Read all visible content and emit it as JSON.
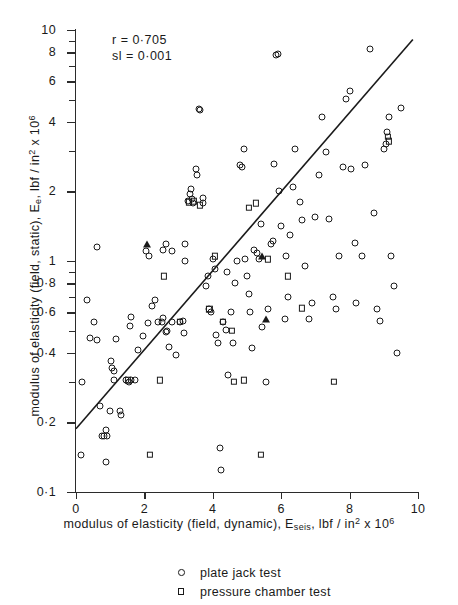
{
  "annotation": {
    "correlation": "r = 0·705",
    "significance": "sl = 0·001"
  },
  "chart_data": {
    "type": "scatter",
    "title": "",
    "xlabel": "modulus of elasticity (field, dynamic), E_seis, lbf / in^2 x 10^6",
    "ylabel": "modulus of elasticity (field, static), E_e, lbf / in^2 x 10^6",
    "xscale": "linear",
    "yscale": "log",
    "xlim": [
      0,
      10
    ],
    "ylim": [
      0.1,
      10
    ],
    "grid": false,
    "legend_position": "below-plot",
    "xticks": [
      "0",
      "2",
      "4",
      "6",
      "8",
      "10"
    ],
    "xtick_values": [
      0,
      2,
      4,
      6,
      8,
      10
    ],
    "yticks": [
      "0·1",
      "0·2",
      "0·4",
      "0·6",
      "0·8",
      "1",
      "2",
      "4",
      "6",
      "8",
      "10"
    ],
    "ytick_values": [
      0.1,
      0.2,
      0.4,
      0.6,
      0.8,
      1,
      2,
      4,
      6,
      8,
      10
    ],
    "yminor_values": [
      0.3,
      0.5,
      0.7,
      0.9,
      3,
      5,
      7,
      9
    ],
    "annotations": [
      "r = 0·705",
      "sl = 0·001"
    ],
    "fit_line": {
      "label": "regression line",
      "x": [
        0.0,
        9.85
      ],
      "y": [
        0.188,
        9.1
      ]
    },
    "series": [
      {
        "name": "plate jack test",
        "marker": "circle",
        "points": [
          [
            0.15,
            0.145
          ],
          [
            0.18,
            0.3
          ],
          [
            0.33,
            0.68
          ],
          [
            0.52,
            0.545
          ],
          [
            0.42,
            0.465
          ],
          [
            0.62,
            0.455
          ],
          [
            0.7,
            0.235
          ],
          [
            0.75,
            0.175
          ],
          [
            0.82,
            0.175
          ],
          [
            0.88,
            0.185
          ],
          [
            0.9,
            0.175
          ],
          [
            0.62,
            1.15
          ],
          [
            0.98,
            0.225
          ],
          [
            1.05,
            0.345
          ],
          [
            1.1,
            0.335
          ],
          [
            1.12,
            0.305
          ],
          [
            1.02,
            0.37
          ],
          [
            1.18,
            0.46
          ],
          [
            1.3,
            0.225
          ],
          [
            1.32,
            0.215
          ],
          [
            1.45,
            0.305
          ],
          [
            1.55,
            0.3
          ],
          [
            1.62,
            0.305
          ],
          [
            1.72,
            0.305
          ],
          [
            0.88,
            0.135
          ],
          [
            1.58,
            0.525
          ],
          [
            1.6,
            0.575
          ],
          [
            1.8,
            0.41
          ],
          [
            1.95,
            0.475
          ],
          [
            2.05,
            1.1
          ],
          [
            2.12,
            1.05
          ],
          [
            2.22,
            0.64
          ],
          [
            2.3,
            0.675
          ],
          [
            2.4,
            0.545
          ],
          [
            2.52,
            0.545
          ],
          [
            2.55,
            0.565
          ],
          [
            2.62,
            0.495
          ],
          [
            2.65,
            0.5
          ],
          [
            2.72,
            0.425
          ],
          [
            2.82,
            0.545
          ],
          [
            2.55,
            1.12
          ],
          [
            2.62,
            1.18
          ],
          [
            2.8,
            1.1
          ],
          [
            2.92,
            0.39
          ],
          [
            3.05,
            0.545
          ],
          [
            3.12,
            0.55
          ],
          [
            3.15,
            0.49
          ],
          [
            3.18,
            1.0
          ],
          [
            3.2,
            1.18
          ],
          [
            3.28,
            1.82
          ],
          [
            3.32,
            1.95
          ],
          [
            3.35,
            2.05
          ],
          [
            3.4,
            1.85
          ],
          [
            3.42,
            1.78
          ],
          [
            3.52,
            2.5
          ],
          [
            3.55,
            2.35
          ],
          [
            3.6,
            4.55
          ],
          [
            3.62,
            4.5
          ],
          [
            3.7,
            1.78
          ],
          [
            3.72,
            1.88
          ],
          [
            3.8,
            0.78
          ],
          [
            3.85,
            0.86
          ],
          [
            3.9,
            0.62
          ],
          [
            3.95,
            0.6
          ],
          [
            4.0,
            1.02
          ],
          [
            4.05,
            0.92
          ],
          [
            4.1,
            0.48
          ],
          [
            4.15,
            0.44
          ],
          [
            4.2,
            0.155
          ],
          [
            4.25,
            0.125
          ],
          [
            4.3,
            0.545
          ],
          [
            4.38,
            0.505
          ],
          [
            4.45,
            0.32
          ],
          [
            4.52,
            0.6
          ],
          [
            4.6,
            0.44
          ],
          [
            4.65,
            0.8
          ],
          [
            4.7,
            1.0
          ],
          [
            4.8,
            2.6
          ],
          [
            4.85,
            2.55
          ],
          [
            4.9,
            3.05
          ],
          [
            4.95,
            1.02
          ],
          [
            5.0,
            0.86
          ],
          [
            5.05,
            0.72
          ],
          [
            5.1,
            0.6
          ],
          [
            5.15,
            0.42
          ],
          [
            5.2,
            1.12
          ],
          [
            5.3,
            1.08
          ],
          [
            5.35,
            1.02
          ],
          [
            5.45,
            0.52
          ],
          [
            5.55,
            0.3
          ],
          [
            5.6,
            0.62
          ],
          [
            5.7,
            1.18
          ],
          [
            5.75,
            1.22
          ],
          [
            5.8,
            2.62
          ],
          [
            5.85,
            7.8
          ],
          [
            5.9,
            7.85
          ],
          [
            5.95,
            2.0
          ],
          [
            6.0,
            1.42
          ],
          [
            6.1,
            0.56
          ],
          [
            6.2,
            0.7
          ],
          [
            6.25,
            1.3
          ],
          [
            6.35,
            2.1
          ],
          [
            6.4,
            3.05
          ],
          [
            6.55,
            1.8
          ],
          [
            6.6,
            1.5
          ],
          [
            6.7,
            0.95
          ],
          [
            6.8,
            0.56
          ],
          [
            6.9,
            0.66
          ],
          [
            7.0,
            1.55
          ],
          [
            7.1,
            2.35
          ],
          [
            7.2,
            4.2
          ],
          [
            7.3,
            2.95
          ],
          [
            7.4,
            1.52
          ],
          [
            7.5,
            0.7
          ],
          [
            7.6,
            0.62
          ],
          [
            7.7,
            1.05
          ],
          [
            7.8,
            2.55
          ],
          [
            7.9,
            5.05
          ],
          [
            8.0,
            5.45
          ],
          [
            8.05,
            2.5
          ],
          [
            8.15,
            1.2
          ],
          [
            8.2,
            0.66
          ],
          [
            8.35,
            1.05
          ],
          [
            8.45,
            2.6
          ],
          [
            8.6,
            8.3
          ],
          [
            8.7,
            1.62
          ],
          [
            8.8,
            0.62
          ],
          [
            8.9,
            0.55
          ],
          [
            9.0,
            3.05
          ],
          [
            9.05,
            3.2
          ],
          [
            9.1,
            3.6
          ],
          [
            9.15,
            4.2
          ],
          [
            9.2,
            1.05
          ],
          [
            9.3,
            0.78
          ],
          [
            9.4,
            0.4
          ],
          [
            9.5,
            4.6
          ],
          [
            5.4,
            1.45
          ],
          [
            6.15,
            1.05
          ],
          [
            4.42,
            0.9
          ],
          [
            2.1,
            0.54
          ]
        ]
      },
      {
        "name": "pressure chamber test",
        "marker": "square",
        "points": [
          [
            1.52,
            0.305
          ],
          [
            2.15,
            0.145
          ],
          [
            2.45,
            0.305
          ],
          [
            2.58,
            0.86
          ],
          [
            3.05,
            0.545
          ],
          [
            3.3,
            1.8
          ],
          [
            3.45,
            1.82
          ],
          [
            3.62,
            1.74
          ],
          [
            3.9,
            0.62
          ],
          [
            4.05,
            1.05
          ],
          [
            4.3,
            0.545
          ],
          [
            4.55,
            0.5
          ],
          [
            4.62,
            0.3
          ],
          [
            4.9,
            0.305
          ],
          [
            5.05,
            1.7
          ],
          [
            5.25,
            1.78
          ],
          [
            5.4,
            0.145
          ],
          [
            5.6,
            1.02
          ],
          [
            6.2,
            0.86
          ],
          [
            6.6,
            0.625
          ],
          [
            7.55,
            0.3
          ],
          [
            9.12,
            3.45
          ],
          [
            9.15,
            3.3
          ]
        ]
      },
      {
        "name": "other test",
        "marker": "triangle",
        "points": [
          [
            2.08,
            1.18
          ],
          [
            5.45,
            1.05
          ],
          [
            5.55,
            0.56
          ]
        ]
      }
    ]
  },
  "legend": {
    "items": [
      {
        "marker": "circle",
        "label": "plate jack test"
      },
      {
        "marker": "square",
        "label": "pressure chamber test"
      }
    ]
  },
  "axis_titles": {
    "x_prefix": "modulus of elasticity (field, dynamic), E",
    "x_sub": "seis",
    "x_mid": ", lbf / in",
    "x_sup": "2",
    "x_mid2": " x 10",
    "x_sup2": "6",
    "y_prefix": "modulus of elasticity (field, static), E",
    "y_sub": "e",
    "y_mid": ", lbf / in",
    "y_sup": "2",
    "y_mid2": " x 10",
    "y_sup2": "6"
  },
  "colors": {
    "ink": "#1a1a1a",
    "axis": "#2b2b2b",
    "background": "#ffffff"
  }
}
